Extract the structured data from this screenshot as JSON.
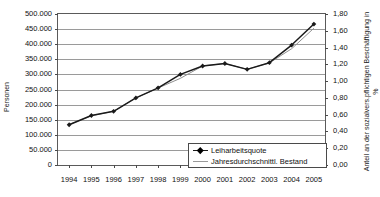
{
  "chart_data": {
    "type": "line",
    "title": "",
    "subtitle": "",
    "xlabel": "",
    "ylabel": "Personen",
    "ylabel_right": "Anteil an der sozialvers.pflichtigen Beschäftigung in %",
    "grid": true,
    "legend_position": "bottom-right",
    "categories": [
      "1994",
      "1995",
      "1996",
      "1997",
      "1998",
      "1999",
      "2000",
      "2001",
      "2002",
      "2003",
      "2004",
      "2005"
    ],
    "ylim": [
      0,
      500000
    ],
    "yticks": [
      0,
      50000,
      100000,
      150000,
      200000,
      250000,
      300000,
      350000,
      400000,
      450000,
      500000
    ],
    "ytick_labels": [
      "0",
      "50.000",
      "100.000",
      "150.000",
      "200.000",
      "250.000",
      "300.000",
      "350.000",
      "400.000",
      "450.000",
      "500.000"
    ],
    "ylim_right": [
      0.0,
      1.8
    ],
    "yticks_right": [
      0.0,
      0.2,
      0.4,
      0.6,
      0.8,
      1.0,
      1.2,
      1.4,
      1.6,
      1.8
    ],
    "ytick_labels_right": [
      "0,00",
      "0,20",
      "0,40",
      "0,60",
      "0,80",
      "1,00",
      "1,20",
      "1,40",
      "1,60",
      "1,80"
    ],
    "series": [
      {
        "name": "Leiharbeitsquote",
        "axis": "right",
        "unit": "%",
        "color": "#1a1a1a",
        "marker": "diamond",
        "values": [
          0.48,
          0.59,
          0.64,
          0.8,
          0.92,
          1.08,
          1.18,
          1.21,
          1.14,
          1.22,
          1.43,
          1.68
        ]
      },
      {
        "name": "Jahresdurchschnittl. Bestand",
        "axis": "left",
        "unit": "Personen",
        "color": "#8f8f8f",
        "marker": "none",
        "values": [
          134000,
          163000,
          178000,
          222000,
          255000,
          287000,
          328000,
          336000,
          317000,
          338000,
          385000,
          453000
        ]
      }
    ]
  },
  "legend": {
    "items": [
      {
        "label": "Leiharbeitsquote"
      },
      {
        "label": "Jahresdurchschnittl. Bestand"
      }
    ]
  }
}
